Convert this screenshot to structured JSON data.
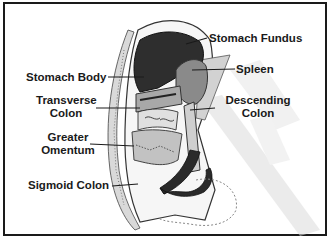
{
  "diagram": {
    "type": "anatomical illustration",
    "labels": [
      {
        "id": "stomach-fundus",
        "text": "Stomach Fundus"
      },
      {
        "id": "stomach-body",
        "text": "Stomach Body"
      },
      {
        "id": "spleen",
        "text": "Spleen"
      },
      {
        "id": "transverse-colon",
        "line1": "Transverse",
        "line2": "Colon"
      },
      {
        "id": "descending-colon",
        "line1": "Descending",
        "line2": "Colon"
      },
      {
        "id": "greater-omentum",
        "line1": "Greater",
        "line2": "Omentum"
      },
      {
        "id": "sigmoid-colon",
        "text": "Sigmoid Colon"
      }
    ],
    "colors": {
      "border": "#1a1a1a",
      "stomach": "#2e2e2e",
      "spleen": "#8a8a8a",
      "tissue": "#bdbdbd",
      "shadow": "#e4e4e4",
      "background": "#ffffff"
    }
  }
}
